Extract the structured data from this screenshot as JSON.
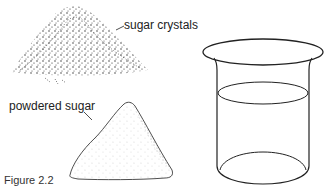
{
  "figure": {
    "caption": "Figure 2.2",
    "labels": {
      "sugar_crystals": "sugar crystals",
      "powdered_sugar": "powdered sugar"
    },
    "objects": [
      {
        "name": "sugar-crystals-pile",
        "description": "coarse stippled mound of sugar crystals"
      },
      {
        "name": "powdered-sugar-pile",
        "description": "finely stippled cone of powdered sugar"
      },
      {
        "name": "beaker",
        "description": "glass beaker partially filled with water"
      }
    ],
    "colors": {
      "ink": "#222222",
      "background": "#ffffff"
    }
  }
}
